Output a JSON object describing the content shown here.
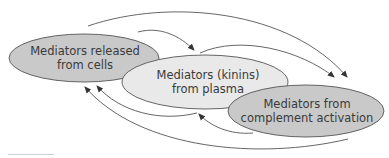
{
  "diagram": {
    "nodes": [
      {
        "id": "cells",
        "line1": "Mediators released",
        "line2": "from cells",
        "fill": "#c9c9c9"
      },
      {
        "id": "plasma",
        "line1": "Mediators (kinins)",
        "line2": "from plasma",
        "fill": "#e9e9e9"
      },
      {
        "id": "complement",
        "line1": "Mediators from",
        "line2": "complement activation",
        "fill": "#c9c9c9"
      }
    ],
    "edges": [
      {
        "from": "cells",
        "to": "complement"
      },
      {
        "from": "cells",
        "to": "plasma"
      },
      {
        "from": "plasma",
        "to": "complement"
      },
      {
        "from": "plasma",
        "to": "cells"
      },
      {
        "from": "complement",
        "to": "plasma"
      },
      {
        "from": "complement",
        "to": "cells"
      }
    ],
    "colors": {
      "stroke": "#555555",
      "text": "#3a3a3a"
    }
  }
}
